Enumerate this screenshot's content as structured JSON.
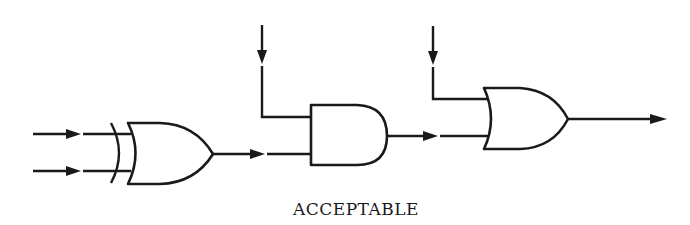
{
  "diagram": {
    "caption": "ACCEPTABLE",
    "stroke_color": "#1a1a1a",
    "background_color": "#ffffff",
    "gates": [
      {
        "id": "xor-gate",
        "type": "XOR",
        "inputs": 2,
        "output_to": "and-gate"
      },
      {
        "id": "and-gate",
        "type": "AND",
        "inputs": 2,
        "input_sources": [
          "external-input-top",
          "xor-gate"
        ],
        "output_to": "or-gate"
      },
      {
        "id": "or-gate",
        "type": "OR",
        "inputs": 2,
        "input_sources": [
          "external-input-top",
          "and-gate"
        ],
        "output_to": "output"
      }
    ],
    "external_inputs": [
      {
        "id": "xor-input-a",
        "direction": "right"
      },
      {
        "id": "xor-input-b",
        "direction": "right"
      },
      {
        "id": "and-input-vertical",
        "direction": "down"
      },
      {
        "id": "or-input-vertical",
        "direction": "down"
      }
    ],
    "output": {
      "id": "final-output",
      "direction": "right"
    }
  }
}
